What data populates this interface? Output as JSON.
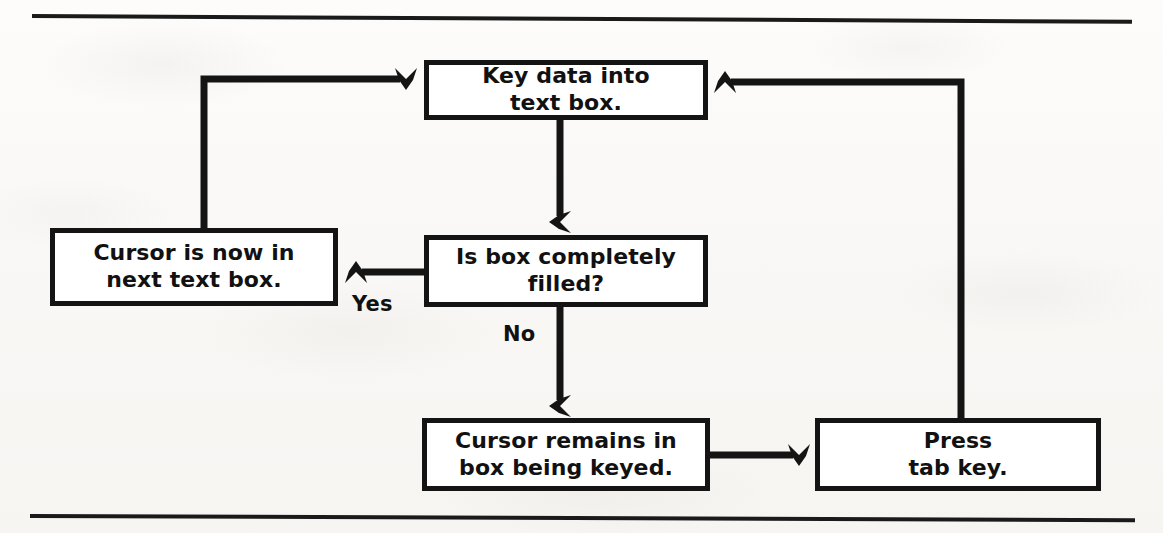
{
  "document": {
    "title": "Text box keying flowchart",
    "rules": {
      "top": "horizontal-rule",
      "bottom": "horizontal-rule"
    }
  },
  "colors": {
    "ink": "#141414",
    "paper": "#fbfaf8",
    "box_fill": "#ffffff"
  },
  "flowchart": {
    "type": "flowchart",
    "nodes": [
      {
        "id": "key_data",
        "label": "Key data into\ntext box.",
        "shape": "rectangle"
      },
      {
        "id": "is_filled",
        "label": "Is box completely\nfilled?",
        "shape": "rectangle"
      },
      {
        "id": "cursor_next",
        "label": "Cursor is now in\nnext text box.",
        "shape": "rectangle"
      },
      {
        "id": "cursor_remains",
        "label": "Cursor remains in\nbox being keyed.",
        "shape": "rectangle"
      },
      {
        "id": "press_tab",
        "label": "Press\ntab key.",
        "shape": "rectangle"
      }
    ],
    "edges": [
      {
        "from": "key_data",
        "to": "is_filled",
        "label": "",
        "style": "straight-down"
      },
      {
        "from": "is_filled",
        "to": "cursor_next",
        "label": "Yes",
        "style": "left"
      },
      {
        "from": "is_filled",
        "to": "cursor_remains",
        "label": "No",
        "style": "straight-down"
      },
      {
        "from": "cursor_next",
        "to": "key_data",
        "label": "",
        "style": "up-and-right"
      },
      {
        "from": "cursor_remains",
        "to": "press_tab",
        "label": "",
        "style": "right"
      },
      {
        "from": "press_tab",
        "to": "key_data",
        "label": "",
        "style": "up-and-left"
      }
    ],
    "labels": {
      "yes": "Yes",
      "no": "No"
    }
  }
}
